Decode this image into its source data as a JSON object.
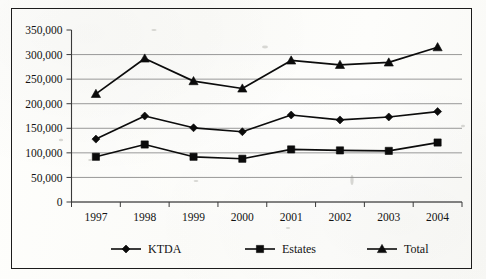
{
  "chart_data": {
    "type": "line",
    "title": "",
    "subtitle": "",
    "xlabel": "",
    "ylabel": "",
    "categories": [
      "1997",
      "1998",
      "1999",
      "2000",
      "2001",
      "2002",
      "2003",
      "2004"
    ],
    "series": [
      {
        "name": "KTDA",
        "marker": "diamond",
        "values": [
          128000,
          175000,
          151000,
          143000,
          177000,
          167000,
          173000,
          184000
        ]
      },
      {
        "name": "Estates",
        "marker": "square",
        "values": [
          92000,
          117000,
          92000,
          88000,
          107000,
          105000,
          104000,
          121000
        ]
      },
      {
        "name": "Total",
        "marker": "triangle",
        "values": [
          220000,
          292000,
          246000,
          231000,
          288000,
          279000,
          284000,
          315000
        ]
      }
    ],
    "ylim": [
      0,
      350000
    ],
    "ytick_step": 50000,
    "ytick_labels": [
      "350,000",
      "300,000",
      "250,000",
      "200,000",
      "150,000",
      "100,000",
      "50,000",
      "0"
    ],
    "ytick_values": [
      350000,
      300000,
      250000,
      200000,
      150000,
      100000,
      50000,
      0
    ],
    "grid": true,
    "grid_axis": "y",
    "legend_position": "bottom",
    "legend_entries": [
      "KTDA",
      "Estates",
      "Total"
    ],
    "line_color": "#0c0c0c",
    "grid_color": "#8d8d8d",
    "axis_color": "#3a3a3a"
  },
  "axis": {
    "y_labels": [
      {
        "text": "350,000"
      },
      {
        "text": "300,000"
      },
      {
        "text": "250,000"
      },
      {
        "text": "200,000"
      },
      {
        "text": "150,000"
      },
      {
        "text": "100,000"
      },
      {
        "text": "50,000"
      },
      {
        "text": "0"
      }
    ],
    "x_labels": [
      {
        "text": "1997"
      },
      {
        "text": "1998"
      },
      {
        "text": "1999"
      },
      {
        "text": "2000"
      },
      {
        "text": "2001"
      },
      {
        "text": "2002"
      },
      {
        "text": "2003"
      },
      {
        "text": "2004"
      }
    ]
  },
  "legend": {
    "items": [
      {
        "label": "KTDA",
        "marker": "diamond-marker-icon"
      },
      {
        "label": "Estates",
        "marker": "square-marker-icon"
      },
      {
        "label": "Total",
        "marker": "triangle-marker-icon"
      }
    ]
  }
}
